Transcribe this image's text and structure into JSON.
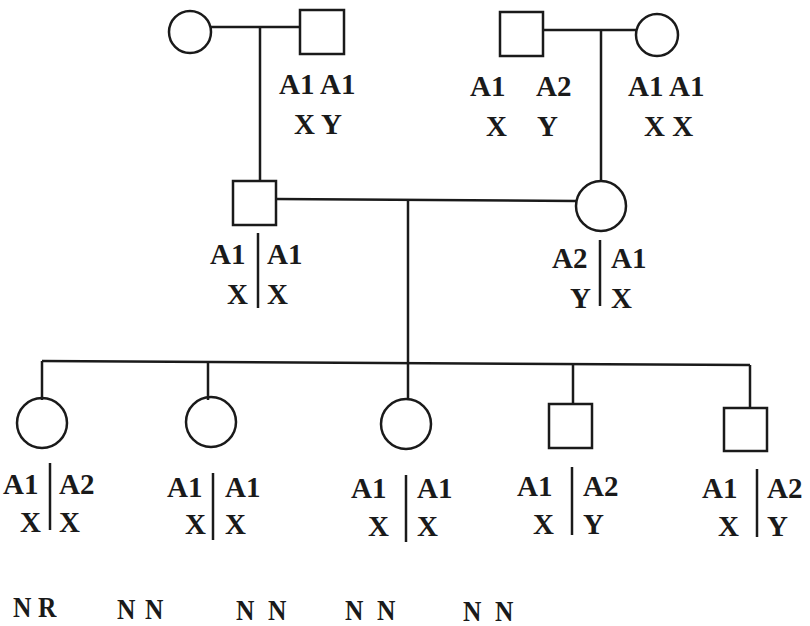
{
  "pedigree": {
    "generation1": {
      "left_couple": {
        "female": {
          "sex": "female",
          "alleles": [
            "A1",
            "A1"
          ],
          "chromosomes": [
            "X",
            "X"
          ],
          "phased": false,
          "labeled": false
        },
        "male": {
          "sex": "male",
          "alleles": [
            "A1",
            "A1"
          ],
          "chromosomes": [
            "X",
            "Y"
          ],
          "phased": false
        }
      },
      "right_couple": {
        "male": {
          "sex": "male",
          "alleles": [
            "A1",
            "A2"
          ],
          "chromosomes": [
            "X",
            "Y"
          ],
          "phased": false
        },
        "female": {
          "sex": "female",
          "alleles": [
            "A1",
            "A1"
          ],
          "chromosomes": [
            "X",
            "X"
          ],
          "phased": false
        }
      }
    },
    "generation2": {
      "male": {
        "sex": "male",
        "alleles": [
          "A1",
          "A1"
        ],
        "chromosomes": [
          "X",
          "X"
        ],
        "phased": true
      },
      "female": {
        "sex": "female",
        "alleles": [
          "A2",
          "A1"
        ],
        "chromosomes": [
          "Y",
          "X"
        ],
        "phased": true
      }
    },
    "generation3": [
      {
        "sex": "female",
        "alleles": [
          "A1",
          "A2"
        ],
        "chromosomes": [
          "X",
          "X"
        ],
        "status": [
          "N",
          "R"
        ]
      },
      {
        "sex": "female",
        "alleles": [
          "A1",
          "A1"
        ],
        "chromosomes": [
          "X",
          "X"
        ],
        "status": [
          "N",
          "N"
        ]
      },
      {
        "sex": "female",
        "alleles": [
          "A1",
          "A1"
        ],
        "chromosomes": [
          "X",
          "X"
        ],
        "status": [
          "N",
          "N"
        ]
      },
      {
        "sex": "male",
        "alleles": [
          "A1",
          "A2"
        ],
        "chromosomes": [
          "X",
          "Y"
        ],
        "status": [
          "N",
          "N"
        ]
      },
      {
        "sex": "male",
        "alleles": [
          "A1",
          "A2"
        ],
        "chromosomes": [
          "X",
          "Y"
        ],
        "status": [
          "N",
          "N"
        ]
      }
    ]
  },
  "labels": {
    "g1_left_male_row1": "A1 A1",
    "g1_left_male_row2": "X Y",
    "g1_right_male_row1_a": "A1",
    "g1_right_male_row1_b": "A2",
    "g1_right_male_row2_a": "X",
    "g1_right_male_row2_b": "Y",
    "g1_right_female_row1": "A1 A1",
    "g1_right_female_row2": "X X",
    "g2_male": {
      "l1": "A1",
      "r1": "A1",
      "l2": "X",
      "r2": "X"
    },
    "g2_female": {
      "l1": "A2",
      "r1": "A1",
      "l2": "Y",
      "r2": "X"
    },
    "g3": [
      {
        "l1": "A1",
        "r1": "A2",
        "l2": "X",
        "r2": "X",
        "s1": "N",
        "s2": "R"
      },
      {
        "l1": "A1",
        "r1": "A1",
        "l2": "X",
        "r2": "X",
        "s1": "N",
        "s2": "N"
      },
      {
        "l1": "A1",
        "r1": "A1",
        "l2": "X",
        "r2": "X",
        "s1": "N",
        "s2": "N"
      },
      {
        "l1": "A1",
        "r1": "A2",
        "l2": "X",
        "r2": "Y",
        "s1": "N",
        "s2": "N"
      },
      {
        "l1": "A1",
        "r1": "A2",
        "l2": "X",
        "r2": "Y",
        "s1": "N",
        "s2": "N"
      }
    ]
  }
}
